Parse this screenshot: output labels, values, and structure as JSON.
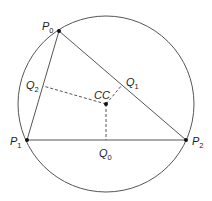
{
  "diagram": {
    "type": "geometry",
    "colors": {
      "stroke": "#555555",
      "dashed": "#555555",
      "point": "#111111",
      "text": "#222222"
    },
    "circle": {
      "cx": 106,
      "cy": 104,
      "r": 88
    },
    "points": {
      "P0": {
        "x": 59,
        "y": 31,
        "label_main": "P",
        "label_sub": "0"
      },
      "P1": {
        "x": 27,
        "y": 140,
        "label_main": "P",
        "label_sub": "1"
      },
      "P2": {
        "x": 186,
        "y": 140,
        "label_main": "P",
        "label_sub": "2"
      },
      "CC": {
        "x": 106,
        "y": 104,
        "label_main": "CC"
      }
    },
    "midpoints": {
      "Q0": {
        "x": 106,
        "y": 140,
        "label_main": "Q",
        "label_sub": "0"
      },
      "Q1": {
        "x": 122,
        "y": 85,
        "label_main": "Q",
        "label_sub": "1"
      },
      "Q2": {
        "x": 43,
        "y": 85,
        "label_main": "Q",
        "label_sub": "2"
      }
    }
  }
}
